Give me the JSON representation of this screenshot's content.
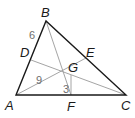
{
  "diagram": {
    "type": "triangle-centroid",
    "vertices": {
      "A": {
        "label": "A",
        "x": 16,
        "y": 95
      },
      "B": {
        "label": "B",
        "x": 46,
        "y": 21
      },
      "C": {
        "label": "C",
        "x": 126,
        "y": 95
      }
    },
    "midpoints": {
      "D": {
        "label": "D",
        "x": 31,
        "y": 60
      },
      "E": {
        "label": "E",
        "x": 86,
        "y": 58
      },
      "F": {
        "label": "F",
        "x": 71,
        "y": 95
      }
    },
    "centroid": {
      "label": "G",
      "x": 71,
      "y": 75
    },
    "segment_labels": {
      "BD": "6",
      "AG": "9",
      "GF": "3"
    },
    "colors": {
      "side": "#1a1a1a",
      "median": "#9a9a9a",
      "label": "#1a1a1a",
      "number": "#6e6e6e"
    }
  }
}
